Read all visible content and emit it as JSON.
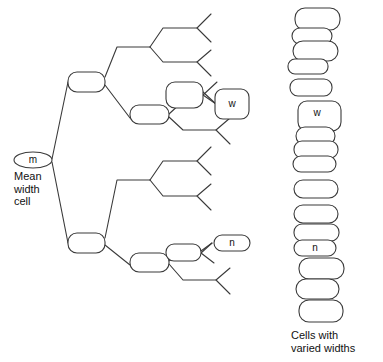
{
  "diagram": {
    "type": "binary-branching-tree-with-cell-stack",
    "colors": {
      "stroke": "#3a3a3a",
      "fill": "#ffffff",
      "text": "#111111",
      "background": "#ffffff"
    },
    "captions": {
      "mean_width_cell": "Mean\nwidth\ncell",
      "cells_with_varied_widths": "Cells with\nvaried widths"
    },
    "labels": {
      "root": "m",
      "branch_w": "w",
      "branch_n": "n",
      "stack_w": "w",
      "stack_n": "n"
    },
    "tree": {
      "root_node": {
        "label": "m",
        "x": 33,
        "y": 160,
        "rx": 19,
        "ry": 8,
        "shape": "ellipse"
      },
      "nodes": [
        {
          "id": "lvl1-upper",
          "x": 68,
          "y": 72,
          "w": 37,
          "h": 20,
          "r": 9,
          "label": ""
        },
        {
          "id": "lvl1-lower",
          "x": 68,
          "y": 233,
          "w": 37,
          "h": 20,
          "r": 9,
          "label": ""
        },
        {
          "id": "lvl2-upper-lower",
          "x": 130,
          "y": 110,
          "w": 39,
          "h": 19,
          "r": 9,
          "label": ""
        },
        {
          "id": "lvl2-lower-lower",
          "x": 130,
          "y": 257,
          "w": 39,
          "h": 19,
          "r": 9,
          "label": ""
        },
        {
          "id": "lvl3-upper-top",
          "x": 166,
          "y": 91,
          "w": 37,
          "h": 26,
          "r": 9,
          "label": ""
        },
        {
          "id": "lvl3-lower-top",
          "x": 166,
          "y": 248,
          "w": 35,
          "h": 17,
          "r": 8,
          "label": ""
        },
        {
          "id": "branch-w-box",
          "x": 215,
          "y": 97,
          "w": 34,
          "h": 30,
          "r": 8,
          "label": "w"
        },
        {
          "id": "branch-n-box",
          "x": 214,
          "y": 240,
          "w": 36,
          "h": 16,
          "r": 8,
          "label": "n"
        }
      ]
    },
    "cell_stack": {
      "note": "Column of rounded cells of varied widths, top to bottom",
      "cells": [
        {
          "index": 1,
          "x": 295,
          "y": 8,
          "w": 45,
          "h": 22,
          "r": 10,
          "label": ""
        },
        {
          "index": 2,
          "x": 292,
          "y": 28,
          "w": 40,
          "h": 16,
          "r": 8,
          "label": ""
        },
        {
          "index": 3,
          "x": 293,
          "y": 41,
          "w": 45,
          "h": 20,
          "r": 10,
          "label": ""
        },
        {
          "index": 4,
          "x": 288,
          "y": 59,
          "w": 40,
          "h": 15,
          "r": 7,
          "label": ""
        },
        {
          "index": 5,
          "x": 290,
          "y": 79,
          "w": 42,
          "h": 17,
          "r": 8,
          "label": ""
        },
        {
          "index": 6,
          "x": 298,
          "y": 101,
          "w": 43,
          "h": 30,
          "r": 9,
          "label": "w"
        },
        {
          "index": 7,
          "x": 296,
          "y": 127,
          "w": 39,
          "h": 18,
          "r": 9,
          "label": ""
        },
        {
          "index": 8,
          "x": 294,
          "y": 141,
          "w": 44,
          "h": 17,
          "r": 9,
          "label": ""
        },
        {
          "index": 9,
          "x": 293,
          "y": 156,
          "w": 43,
          "h": 16,
          "r": 8,
          "label": ""
        },
        {
          "index": 10,
          "x": 294,
          "y": 180,
          "w": 44,
          "h": 18,
          "r": 9,
          "label": ""
        },
        {
          "index": 11,
          "x": 294,
          "y": 205,
          "w": 44,
          "h": 18,
          "r": 9,
          "label": ""
        },
        {
          "index": 12,
          "x": 294,
          "y": 224,
          "w": 45,
          "h": 17,
          "r": 9,
          "label": ""
        },
        {
          "index": 13,
          "x": 294,
          "y": 240,
          "w": 42,
          "h": 16,
          "r": 8,
          "label": "n"
        },
        {
          "index": 14,
          "x": 299,
          "y": 258,
          "w": 45,
          "h": 21,
          "r": 10,
          "label": ""
        },
        {
          "index": 15,
          "x": 296,
          "y": 279,
          "w": 43,
          "h": 20,
          "r": 10,
          "label": ""
        },
        {
          "index": 16,
          "x": 299,
          "y": 300,
          "w": 44,
          "h": 22,
          "r": 10,
          "label": ""
        }
      ]
    },
    "connectors": {
      "description": "Line segments connecting root to branch nodes and terminal V-fork ends",
      "terminal_forks": 8
    }
  }
}
